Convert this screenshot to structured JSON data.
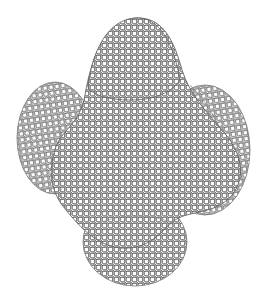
{
  "figure": {
    "colors": {
      "background": "#ffffff",
      "edge": "#3a3a3a",
      "face": "#ffffff",
      "shade": "#e6e6e6"
    },
    "voxel_size_px": 6
  }
}
